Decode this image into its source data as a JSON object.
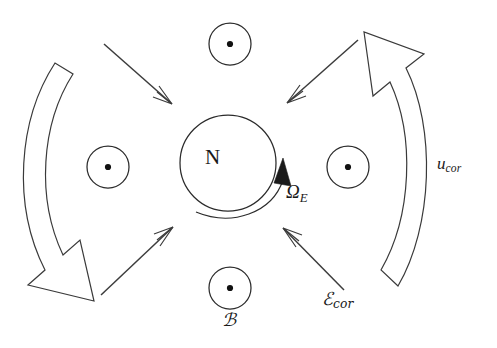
{
  "figure": {
    "kind": "physics-schematic",
    "background_color": "#ffffff",
    "stroke_color": "#2b2b2b",
    "labels": {
      "center_body": "N",
      "rotation_symbol": "Ω",
      "rotation_subscript": "E",
      "corotation_velocity_symbol": "u",
      "corotation_velocity_subscript": "cor",
      "corotation_field_symbol": "ℰ",
      "corotation_field_subscript": "cor",
      "magnetic_field_symbol": "ℬ"
    },
    "field_markers": [
      {
        "name": "magnetic-field-marker-top",
        "cx": 230,
        "cy": 44,
        "r": 21,
        "dot_r": 3.1,
        "direction": "out-of-page"
      },
      {
        "name": "magnetic-field-marker-left",
        "cx": 108,
        "cy": 167,
        "r": 21,
        "dot_r": 3.1,
        "direction": "out-of-page"
      },
      {
        "name": "magnetic-field-marker-right",
        "cx": 348,
        "cy": 167,
        "r": 21,
        "dot_r": 3.1,
        "direction": "out-of-page"
      },
      {
        "name": "magnetic-field-marker-bottom",
        "cx": 230,
        "cy": 288,
        "r": 21,
        "dot_r": 3.1,
        "direction": "out-of-page"
      }
    ],
    "central_body": {
      "cx": 228,
      "cy": 163,
      "r": 48
    },
    "field_arrows": [
      {
        "name": "field-arrow-upper-left",
        "from": [
          104,
          44
        ],
        "to": [
          172,
          104
        ],
        "points_toward": "center"
      },
      {
        "name": "field-arrow-upper-right",
        "from": [
          358,
          40
        ],
        "to": [
          287,
          103
        ],
        "points_toward": "center"
      },
      {
        "name": "field-arrow-lower-left",
        "from": [
          101,
          295
        ],
        "to": [
          173,
          227
        ],
        "points_toward": "center"
      },
      {
        "name": "field-arrow-lower-right",
        "from": [
          344,
          290
        ],
        "to": [
          283,
          228
        ],
        "points_toward": "center"
      }
    ],
    "rotation_arc": {
      "name": "rotation-arc",
      "direction": "counterclockwise",
      "head_at": [
        283,
        166
      ]
    },
    "block_arrows": [
      {
        "name": "corotation-arrow-left",
        "direction": "downward",
        "head_at": [
          88,
          297
        ]
      },
      {
        "name": "corotation-arrow-right",
        "direction": "upward",
        "head_at": [
          366,
          32
        ]
      }
    ]
  }
}
